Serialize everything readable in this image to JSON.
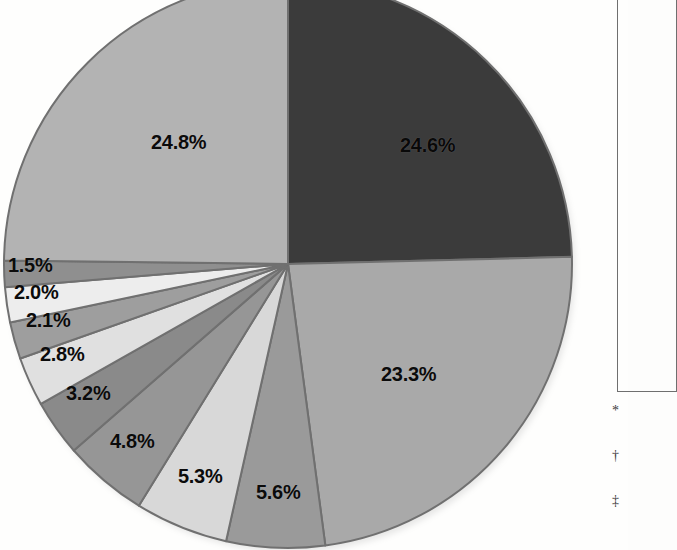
{
  "figure": {
    "background_color": "#fefefd",
    "label_text_color": "#0b0b0b"
  },
  "legend": {
    "present": true,
    "clipped": true,
    "border_color": "#6f6f6f"
  },
  "footnotes": [
    {
      "marker": "*"
    },
    {
      "marker": "†"
    },
    {
      "marker": "‡"
    }
  ],
  "chart_data": {
    "type": "pie",
    "title": "",
    "subtitle": "",
    "xlabel": "",
    "ylabel": "",
    "grid": false,
    "legend_position": "right",
    "start_angle_deg": 0,
    "direction": "clockwise",
    "units": "percent",
    "categories": [
      "Slice 1",
      "Slice 2",
      "Slice 3",
      "Slice 4",
      "Slice 5",
      "Slice 6",
      "Slice 7",
      "Slice 8",
      "Slice 9",
      "Slice 10"
    ],
    "values": [
      24.6,
      23.3,
      5.6,
      5.3,
      4.8,
      3.2,
      2.8,
      2.1,
      2.0,
      24.8
    ],
    "labels": [
      "24.6%",
      "23.3%",
      "5.6%",
      "5.3%",
      "4.8%",
      "3.2%",
      "2.8%",
      "2.1%",
      "2.0%",
      "1.5%",
      "24.8%"
    ],
    "slices": [
      {
        "label": "24.6%",
        "value": 24.6,
        "color": "#3b3b3b"
      },
      {
        "label": "23.3%",
        "value": 23.3,
        "color": "#a9a9a9"
      },
      {
        "label": "5.6%",
        "value": 5.6,
        "color": "#9a9a9a"
      },
      {
        "label": "5.3%",
        "value": 5.3,
        "color": "#d8d8d8"
      },
      {
        "label": "4.8%",
        "value": 4.8,
        "color": "#969696"
      },
      {
        "label": "3.2%",
        "value": 3.2,
        "color": "#8a8a8a"
      },
      {
        "label": "2.8%",
        "value": 2.8,
        "color": "#e0e0e0"
      },
      {
        "label": "2.1%",
        "value": 2.1,
        "color": "#9e9e9e"
      },
      {
        "label": "2.0%",
        "value": 2.0,
        "color": "#ededed"
      },
      {
        "label": "1.5%",
        "value": 1.5,
        "color": "#8f8f8f"
      },
      {
        "label": "24.8%",
        "value": 24.8,
        "color": "#b3b3b3"
      }
    ]
  }
}
